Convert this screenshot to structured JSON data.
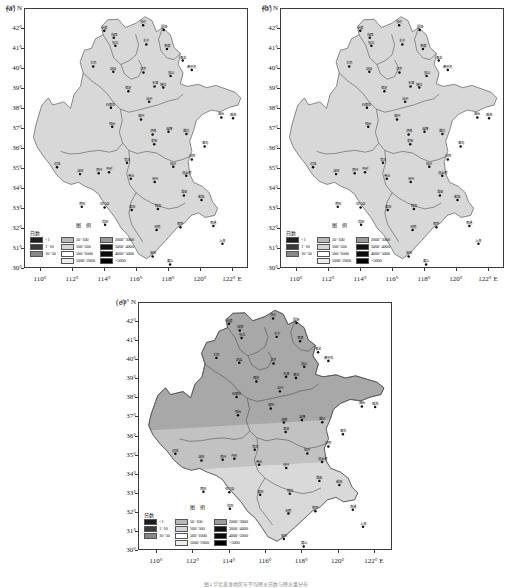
{
  "figure": {
    "caption": "图4 华北黄淮地区年平均降水日数与降水量分布",
    "panels": [
      "(a)",
      "(b)",
      "(c)"
    ]
  },
  "axes": {
    "y_label": "43° N",
    "y_ticks": [
      "42°",
      "41°",
      "40°",
      "39°",
      "38°",
      "37°",
      "36°",
      "35°",
      "34°",
      "33°",
      "32°",
      "31°",
      "30°"
    ],
    "y_values": [
      42,
      41,
      40,
      39,
      38,
      37,
      36,
      35,
      34,
      33,
      32,
      31,
      30
    ],
    "y_range": [
      30,
      43
    ],
    "x_ticks": [
      "110°",
      "112°",
      "114°",
      "116°",
      "118°",
      "120°",
      "122° E"
    ],
    "x_values": [
      110,
      112,
      114,
      116,
      118,
      120,
      122
    ],
    "x_range": [
      109,
      123
    ]
  },
  "legend": {
    "title": "图  例",
    "day_label": "日数",
    "left_column": [
      {
        "label": "<1",
        "color": "#1c1c1c"
      },
      {
        "label": "1~10",
        "color": "#3a3a3a"
      },
      {
        "label": "10~50",
        "color": "#888888"
      }
    ],
    "right_columns": [
      {
        "label": "50~100",
        "color": "#b9b9b9"
      },
      {
        "label": "100~500",
        "color": "#d6d6d6"
      },
      {
        "label": "500~1000",
        "color": "#ffffff"
      },
      {
        "label": "1000~2000",
        "color": "#ededed"
      },
      {
        "label": "2000~3000",
        "color": "#9a9a9a"
      },
      {
        "label": "3000~4000",
        "color": "#111111"
      },
      {
        "label": "4000~5000",
        "color": "#0c0c0c"
      },
      {
        "label": ">5000",
        "color": "#000000"
      }
    ]
  },
  "chart_data": {
    "type": "heatmap",
    "xlabel": "经度 (°E)",
    "ylabel": "纬度 (°N)",
    "xlim": [
      109,
      123
    ],
    "ylim": [
      30,
      43
    ],
    "grid": false,
    "legend_position": "inside-bottom-left",
    "colorbar_levels": [
      "<1",
      "1~10",
      "10~50",
      "50~100",
      "100~500",
      "500~1000",
      "1000~2000",
      "2000~3000",
      "3000~4000",
      "4000~5000",
      ">5000"
    ],
    "panels": [
      {
        "name": "(a)",
        "regions": [
          {
            "name": "whole-domain",
            "class_label": "100~500",
            "fill": "#d8d8d8"
          }
        ]
      },
      {
        "name": "(b)",
        "regions": [
          {
            "name": "whole-domain",
            "class_label": "100~500",
            "fill": "#d8d8d8"
          }
        ]
      },
      {
        "name": "(c)",
        "regions": [
          {
            "name": "north-band",
            "class_label": "2000~3000",
            "fill": "#a8a8a8"
          },
          {
            "name": "central-band",
            "class_label": "1000~2000",
            "fill": "#c2c2c2"
          },
          {
            "name": "south-band",
            "class_label": "500~1000",
            "fill": "#d9d9d9"
          }
        ]
      }
    ],
    "stations": [
      {
        "label": "多伦",
        "lon": 116.45,
        "lat": 42.18
      },
      {
        "label": "张北",
        "lon": 114.7,
        "lat": 41.15
      },
      {
        "label": "康保",
        "lon": 114.6,
        "lat": 41.55
      },
      {
        "label": "化德",
        "lon": 114.0,
        "lat": 41.9
      },
      {
        "label": "承德",
        "lon": 117.95,
        "lat": 40.98
      },
      {
        "label": "丰宁",
        "lon": 116.65,
        "lat": 41.21
      },
      {
        "label": "围场",
        "lon": 117.75,
        "lat": 41.94
      },
      {
        "label": "青龙",
        "lon": 118.95,
        "lat": 40.4
      },
      {
        "label": "秦皇岛",
        "lon": 119.52,
        "lat": 39.93
      },
      {
        "label": "唐山",
        "lon": 118.18,
        "lat": 39.63
      },
      {
        "label": "大同",
        "lon": 113.3,
        "lat": 40.1
      },
      {
        "label": "蔚县",
        "lon": 114.57,
        "lat": 39.84
      },
      {
        "label": "北京",
        "lon": 116.47,
        "lat": 39.8
      },
      {
        "label": "天津",
        "lon": 117.17,
        "lat": 39.1
      },
      {
        "label": "塘沽",
        "lon": 117.72,
        "lat": 39.04
      },
      {
        "label": "保定",
        "lon": 115.52,
        "lat": 38.85
      },
      {
        "label": "石家庄",
        "lon": 114.42,
        "lat": 38.03
      },
      {
        "label": "沧州",
        "lon": 116.83,
        "lat": 38.33
      },
      {
        "label": "邢台",
        "lon": 114.5,
        "lat": 37.07
      },
      {
        "label": "德州",
        "lon": 116.32,
        "lat": 37.43
      },
      {
        "label": "济南",
        "lon": 117.05,
        "lat": 36.68
      },
      {
        "label": "泰安",
        "lon": 117.15,
        "lat": 36.18
      },
      {
        "label": "淄博",
        "lon": 118.05,
        "lat": 36.82
      },
      {
        "label": "潍坊",
        "lon": 119.18,
        "lat": 36.7
      },
      {
        "label": "烟台",
        "lon": 121.38,
        "lat": 37.53
      },
      {
        "label": "威海",
        "lon": 122.12,
        "lat": 37.5
      },
      {
        "label": "青岛",
        "lon": 120.33,
        "lat": 36.07
      },
      {
        "label": "日照",
        "lon": 119.52,
        "lat": 35.42
      },
      {
        "label": "临沂",
        "lon": 118.35,
        "lat": 35.05
      },
      {
        "label": "菏泽",
        "lon": 115.43,
        "lat": 35.25
      },
      {
        "label": "运城",
        "lon": 111.02,
        "lat": 35.03
      },
      {
        "label": "洛阳",
        "lon": 112.47,
        "lat": 34.68
      },
      {
        "label": "郑州",
        "lon": 113.65,
        "lat": 34.72
      },
      {
        "label": "开封",
        "lon": 114.3,
        "lat": 34.77
      },
      {
        "label": "商丘",
        "lon": 115.67,
        "lat": 34.45
      },
      {
        "label": "南阳",
        "lon": 112.58,
        "lat": 33.03
      },
      {
        "label": "驻马店",
        "lon": 114.02,
        "lat": 33.0
      },
      {
        "label": "信阳",
        "lon": 114.05,
        "lat": 32.13
      },
      {
        "label": "阜阳",
        "lon": 115.73,
        "lat": 32.87
      },
      {
        "label": "蚌埠",
        "lon": 117.38,
        "lat": 32.92
      },
      {
        "label": "徐州",
        "lon": 117.18,
        "lat": 34.28
      },
      {
        "label": "连云港",
        "lon": 119.17,
        "lat": 34.6
      },
      {
        "label": "淮安",
        "lon": 119.02,
        "lat": 33.6
      },
      {
        "label": "盐城",
        "lon": 120.13,
        "lat": 33.38
      },
      {
        "label": "南京",
        "lon": 118.8,
        "lat": 32.0
      },
      {
        "label": "合肥",
        "lon": 117.3,
        "lat": 31.87
      },
      {
        "label": "南通",
        "lon": 120.88,
        "lat": 32.07
      },
      {
        "label": "上海",
        "lon": 121.45,
        "lat": 31.17
      },
      {
        "label": "安庆",
        "lon": 117.05,
        "lat": 30.53
      },
      {
        "label": "黄山",
        "lon": 118.15,
        "lat": 30.13
      }
    ]
  }
}
